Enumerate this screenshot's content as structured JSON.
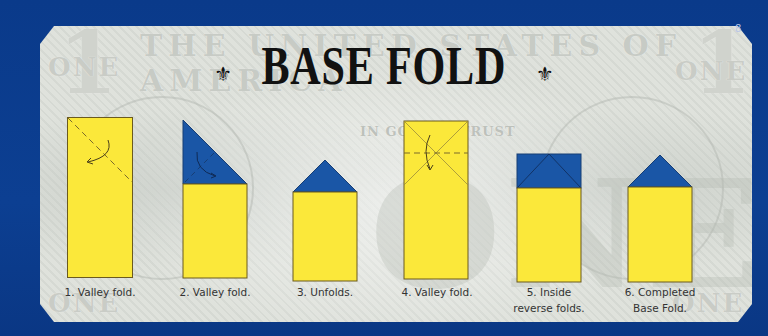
{
  "page_number": "8",
  "title": "BASE FOLD",
  "title_ornament_left": "⚜",
  "title_ornament_right": "⚜",
  "background_banknote": {
    "header_text": "THE UNITED STATES OF AMERICA",
    "motto": "IN GOD WE TRUST",
    "corner_word": "ONE",
    "corner_numeral": "1",
    "center_word": "ONE"
  },
  "colors": {
    "page_blue": "#0b3b8c",
    "paper_yellow": "#fbe83a",
    "paper_blue": "#1a56a6",
    "outline": "#6b5a1e"
  },
  "steps": [
    {
      "number": 1,
      "caption_lines": [
        "1. Valley fold."
      ]
    },
    {
      "number": 2,
      "caption_lines": [
        "2. Valley fold."
      ]
    },
    {
      "number": 3,
      "caption_lines": [
        "3. Unfolds."
      ]
    },
    {
      "number": 4,
      "caption_lines": [
        "4. Valley fold."
      ]
    },
    {
      "number": 5,
      "caption_lines": [
        "5. Inside",
        "reverse folds."
      ]
    },
    {
      "number": 6,
      "caption_lines": [
        "6. Completed",
        "Base Fold."
      ]
    }
  ]
}
